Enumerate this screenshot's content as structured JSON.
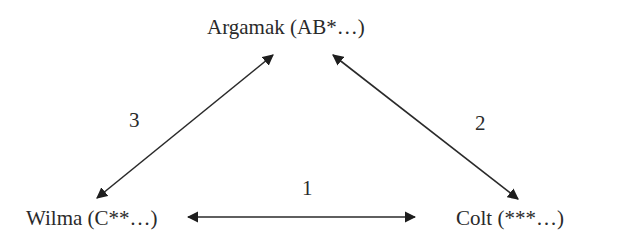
{
  "diagram": {
    "nodes": [
      {
        "id": "argamak",
        "label": "Argamak (AB*…)"
      },
      {
        "id": "wilma",
        "label": "Wilma (C**…)"
      },
      {
        "id": "colt",
        "label": "Colt (***…)"
      }
    ],
    "edges": [
      {
        "id": "1",
        "label": "1",
        "from": "wilma",
        "to": "colt",
        "direction": "bidirectional"
      },
      {
        "id": "2",
        "label": "2",
        "from": "argamak",
        "to": "colt",
        "direction": "bidirectional"
      },
      {
        "id": "3",
        "label": "3",
        "from": "argamak",
        "to": "wilma",
        "direction": "bidirectional"
      }
    ],
    "colors": {
      "line": "#2a2a2a",
      "text": "#2a2a2a",
      "background": "#ffffff"
    }
  }
}
